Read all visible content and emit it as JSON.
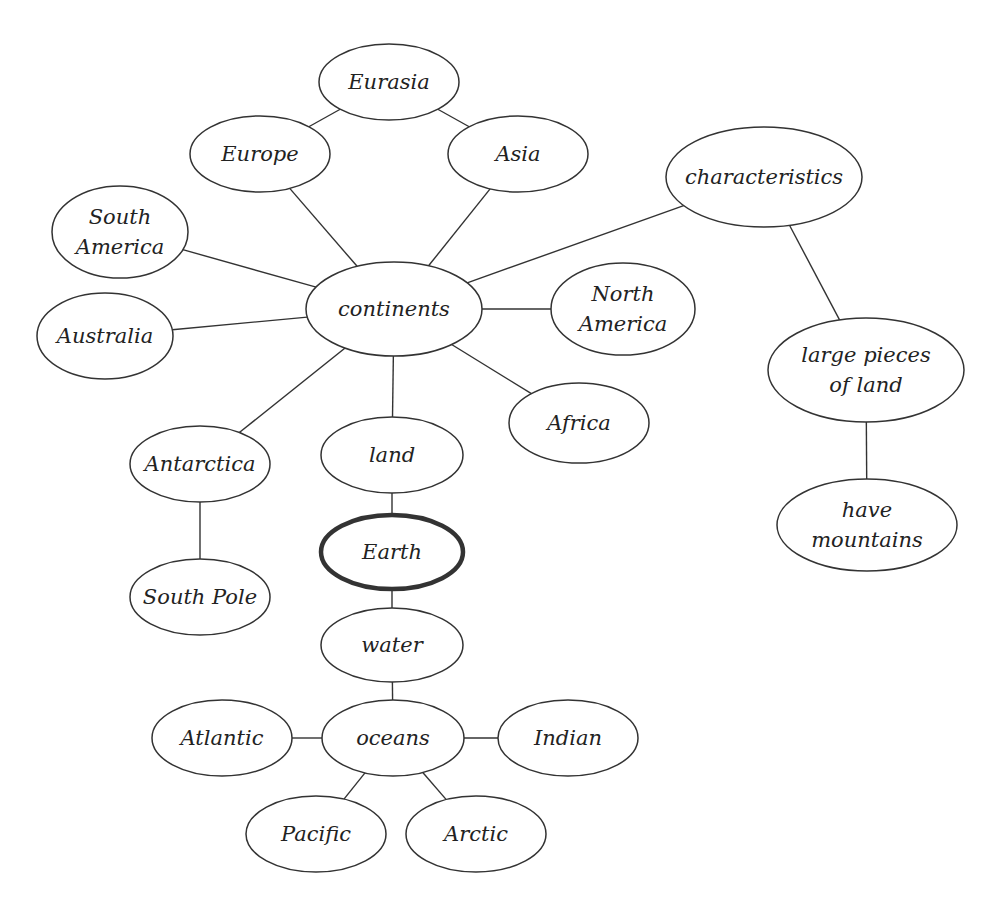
{
  "diagram": {
    "type": "concept-map",
    "central_node": "earth",
    "colors": {
      "stroke": "#333333",
      "text": "#222222",
      "background": "#ffffff"
    },
    "nodes": [
      {
        "id": "eurasia",
        "lines": [
          "Eurasia"
        ],
        "cx": 389,
        "cy": 82,
        "rx": 70,
        "ry": 38
      },
      {
        "id": "europe",
        "lines": [
          "Europe"
        ],
        "cx": 260,
        "cy": 154,
        "rx": 70,
        "ry": 38
      },
      {
        "id": "asia",
        "lines": [
          "Asia"
        ],
        "cx": 518,
        "cy": 154,
        "rx": 70,
        "ry": 38
      },
      {
        "id": "characteristics",
        "lines": [
          "characteristics"
        ],
        "cx": 764,
        "cy": 177,
        "rx": 98,
        "ry": 50
      },
      {
        "id": "south-america",
        "lines": [
          "South",
          "America"
        ],
        "cx": 120,
        "cy": 232,
        "rx": 68,
        "ry": 46
      },
      {
        "id": "continents",
        "lines": [
          "continents"
        ],
        "cx": 394,
        "cy": 309,
        "rx": 88,
        "ry": 47
      },
      {
        "id": "north-america",
        "lines": [
          "North",
          "America"
        ],
        "cx": 623,
        "cy": 309,
        "rx": 72,
        "ry": 46
      },
      {
        "id": "australia",
        "lines": [
          "Australia"
        ],
        "cx": 105,
        "cy": 336,
        "rx": 68,
        "ry": 43
      },
      {
        "id": "large-pieces",
        "lines": [
          "large pieces",
          "of land"
        ],
        "cx": 866,
        "cy": 370,
        "rx": 98,
        "ry": 52
      },
      {
        "id": "africa",
        "lines": [
          "Africa"
        ],
        "cx": 579,
        "cy": 423,
        "rx": 70,
        "ry": 40
      },
      {
        "id": "antarctica",
        "lines": [
          "Antarctica"
        ],
        "cx": 200,
        "cy": 464,
        "rx": 70,
        "ry": 38
      },
      {
        "id": "land",
        "lines": [
          "land"
        ],
        "cx": 392,
        "cy": 455,
        "rx": 71,
        "ry": 38
      },
      {
        "id": "have-mountains",
        "lines": [
          "have",
          "mountains"
        ],
        "cx": 867,
        "cy": 525,
        "rx": 90,
        "ry": 46
      },
      {
        "id": "earth",
        "lines": [
          "Earth"
        ],
        "cx": 392,
        "cy": 552,
        "rx": 71,
        "ry": 37,
        "bold": true
      },
      {
        "id": "south-pole",
        "lines": [
          "South Pole"
        ],
        "cx": 200,
        "cy": 597,
        "rx": 70,
        "ry": 38
      },
      {
        "id": "water",
        "lines": [
          "water"
        ],
        "cx": 392,
        "cy": 645,
        "rx": 71,
        "ry": 37
      },
      {
        "id": "atlantic",
        "lines": [
          "Atlantic"
        ],
        "cx": 222,
        "cy": 738,
        "rx": 70,
        "ry": 38
      },
      {
        "id": "oceans",
        "lines": [
          "oceans"
        ],
        "cx": 393,
        "cy": 738,
        "rx": 71,
        "ry": 38
      },
      {
        "id": "indian",
        "lines": [
          "Indian"
        ],
        "cx": 568,
        "cy": 738,
        "rx": 70,
        "ry": 38
      },
      {
        "id": "pacific",
        "lines": [
          "Pacific"
        ],
        "cx": 316,
        "cy": 834,
        "rx": 70,
        "ry": 38
      },
      {
        "id": "arctic",
        "lines": [
          "Arctic"
        ],
        "cx": 476,
        "cy": 834,
        "rx": 70,
        "ry": 38
      }
    ],
    "edges": [
      [
        "eurasia",
        "europe"
      ],
      [
        "eurasia",
        "asia"
      ],
      [
        "europe",
        "continents"
      ],
      [
        "asia",
        "continents"
      ],
      [
        "south-america",
        "continents"
      ],
      [
        "australia",
        "continents"
      ],
      [
        "north-america",
        "continents"
      ],
      [
        "africa",
        "continents"
      ],
      [
        "antarctica",
        "continents"
      ],
      [
        "land",
        "continents"
      ],
      [
        "characteristics",
        "continents"
      ],
      [
        "characteristics",
        "large-pieces"
      ],
      [
        "large-pieces",
        "have-mountains"
      ],
      [
        "antarctica",
        "south-pole"
      ],
      [
        "land",
        "earth"
      ],
      [
        "earth",
        "water"
      ],
      [
        "water",
        "oceans"
      ],
      [
        "oceans",
        "atlantic"
      ],
      [
        "oceans",
        "indian"
      ],
      [
        "oceans",
        "pacific"
      ],
      [
        "oceans",
        "arctic"
      ]
    ]
  }
}
